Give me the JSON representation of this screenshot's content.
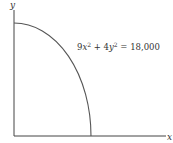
{
  "diagram": {
    "type": "quarter-ellipse",
    "equation_parts": {
      "a": "9",
      "v1": "x",
      "exp1": "2",
      "plus": " + 4",
      "v2": "y",
      "exp2": "2",
      "rhs": " = 18,000"
    },
    "axes": {
      "x_label": "x",
      "y_label": "y"
    },
    "colors": {
      "axis": "#444444",
      "curve": "#555555",
      "text": "#333333"
    }
  }
}
